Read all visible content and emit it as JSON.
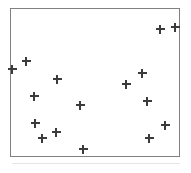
{
  "figure": {
    "width": 191,
    "height": 173,
    "background_color": "#ffffff",
    "caption": ""
  },
  "frame": {
    "left": 10,
    "top": 8,
    "width": 170,
    "height": 149,
    "border_color": "#808080",
    "border_width": 1,
    "fill_color": "#ffffff"
  },
  "artifact": {
    "left": 12,
    "top": 163,
    "width": 168,
    "height": 1,
    "color": "#d8d8d8"
  },
  "chart_data": {
    "type": "scatter",
    "title": "",
    "subtitle": "",
    "xlabel": "",
    "ylabel": "",
    "xlim": [
      0,
      170
    ],
    "ylim": [
      0,
      149
    ],
    "grid": false,
    "legend": null,
    "legend_position": "none",
    "axis_ticks": [],
    "tick_labels": [],
    "marker_symbol": "plus",
    "marker_color": "#3b3b3b",
    "marker_size": 9,
    "point_count": 16,
    "annotations": [],
    "series": [
      {
        "name": "points",
        "marker": "plus",
        "color": "#3b3b3b",
        "points": [
          {
            "px": 11,
            "py": 68
          },
          {
            "px": 25,
            "py": 60
          },
          {
            "px": 159,
            "py": 28
          },
          {
            "px": 174,
            "py": 26
          },
          {
            "px": 56,
            "py": 78
          },
          {
            "px": 141,
            "py": 72
          },
          {
            "px": 33,
            "py": 95
          },
          {
            "px": 79,
            "py": 104
          },
          {
            "px": 146,
            "py": 100
          },
          {
            "px": 34,
            "py": 122
          },
          {
            "px": 55,
            "py": 131
          },
          {
            "px": 41,
            "py": 137
          },
          {
            "px": 164,
            "py": 124
          },
          {
            "px": 148,
            "py": 137
          },
          {
            "px": 82,
            "py": 148
          },
          {
            "px": 125,
            "py": 83
          }
        ]
      }
    ],
    "x": [
      11,
      25,
      159,
      174,
      56,
      141,
      33,
      79,
      146,
      34,
      55,
      41,
      164,
      148,
      82,
      125
    ],
    "y": [
      68,
      60,
      28,
      26,
      78,
      72,
      95,
      104,
      100,
      122,
      131,
      137,
      124,
      137,
      148,
      83
    ]
  }
}
